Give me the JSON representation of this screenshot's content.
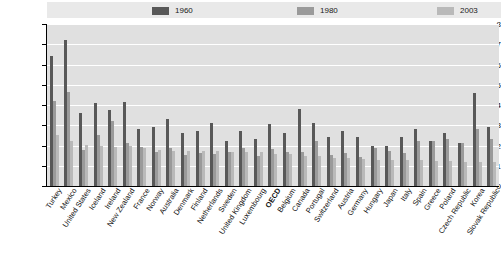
{
  "chart_data": {
    "type": "bar",
    "title": "",
    "xlabel": "",
    "ylabel": "",
    "ylim": [
      0,
      8
    ],
    "yticks": [
      "0",
      "1",
      "2",
      "3",
      "4",
      "5",
      "6",
      "7",
      "8"
    ],
    "grid": true,
    "legend_position": "top",
    "categories": [
      "Turkey",
      "Mexico",
      "United States",
      "Iceland",
      "Ireland",
      "New Zealand",
      "France",
      "Norway",
      "Australia",
      "Denmark",
      "Finland",
      "Netherlands",
      "Sweden",
      "United Kingdom",
      "Luxembourg",
      "OECD",
      "Belgium",
      "Canada",
      "Portugal",
      "Switzerland",
      "Austria",
      "Germany",
      "Hungary",
      "Japan",
      "Italy",
      "Spain",
      "Greece",
      "Poland",
      "Czech Republic",
      "Korea",
      "Slovak Republic"
    ],
    "highlight_category": "OECD",
    "series": [
      {
        "name": "1960",
        "color": "#585858",
        "values": [
          6.4,
          7.2,
          3.6,
          4.1,
          3.75,
          4.15,
          2.8,
          2.9,
          3.3,
          2.6,
          2.7,
          3.1,
          2.2,
          2.7,
          2.3,
          3.05,
          2.6,
          3.8,
          3.1,
          2.4,
          2.7,
          2.4,
          2.0,
          2.0,
          2.4,
          2.8,
          2.2,
          2.6,
          2.1,
          4.6,
          2.9
        ]
      },
      {
        "name": "1980",
        "color": "#9a9a9a",
        "values": [
          4.2,
          4.65,
          1.8,
          2.5,
          3.2,
          2.1,
          1.95,
          1.7,
          1.9,
          1.55,
          1.65,
          1.6,
          1.7,
          1.9,
          1.5,
          1.85,
          1.7,
          1.7,
          2.2,
          1.55,
          1.65,
          1.45,
          1.9,
          1.75,
          1.65,
          2.2,
          2.2,
          2.3,
          2.1,
          2.8,
          2.3
        ]
      },
      {
        "name": "2003",
        "color": "#b9b9b9",
        "values": [
          2.5,
          2.2,
          2.05,
          2.0,
          1.95,
          2.0,
          1.9,
          1.8,
          1.75,
          1.75,
          1.75,
          1.75,
          1.7,
          1.7,
          1.7,
          1.6,
          1.6,
          1.5,
          1.5,
          1.4,
          1.4,
          1.35,
          1.3,
          1.3,
          1.3,
          1.3,
          1.25,
          1.25,
          1.2,
          1.2,
          1.2
        ]
      }
    ]
  },
  "legend": {
    "items": [
      {
        "label": "1960",
        "color": "#585858"
      },
      {
        "label": "1980",
        "color": "#9a9a9a"
      },
      {
        "label": "2003",
        "color": "#b9b9b9"
      }
    ]
  }
}
